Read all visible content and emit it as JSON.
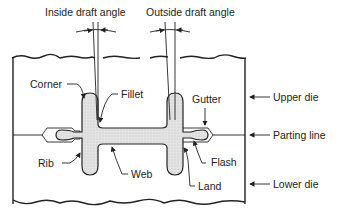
{
  "diagram": {
    "labels": {
      "inside_draft_angle": "Inside draft angle",
      "outside_draft_angle": "Outside draft angle",
      "corner": "Corner",
      "fillet": "Fillet",
      "gutter": "Gutter",
      "upper_die": "Upper die",
      "parting_line": "Parting line",
      "rib": "Rib",
      "web": "Web",
      "flash": "Flash",
      "land": "Land",
      "lower_die": "Lower die"
    },
    "colors": {
      "line": "#222222",
      "forging_fill": "#d9d9d9",
      "background": "#ffffff"
    }
  }
}
